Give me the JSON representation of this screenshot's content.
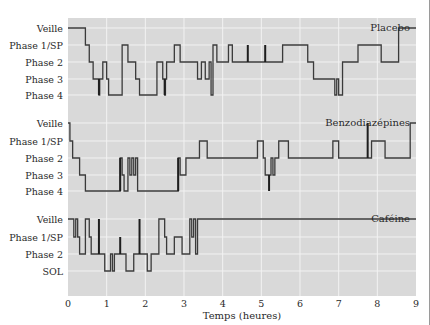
{
  "colors": {
    "plot_bg": "#d9d9d9",
    "grid": "#f2f2f2",
    "line": "#3a3a3a",
    "text": "#2a2a2a"
  },
  "chart_data": {
    "type": "line",
    "subtype": "step (hypnogram)",
    "xlabel": "Temps (heures)",
    "xlim": [
      0,
      9
    ],
    "xticks": [
      0,
      1,
      2,
      3,
      4,
      5,
      6,
      7,
      8,
      9
    ],
    "grid": true,
    "panels": [
      {
        "title": "Placebo",
        "levels": [
          "Veille",
          "Phase 1/SP",
          "Phase 2",
          "Phase 3",
          "Phase 4"
        ],
        "steps": [
          [
            0,
            0
          ],
          [
            0.45,
            1
          ],
          [
            0.55,
            2
          ],
          [
            0.65,
            3
          ],
          [
            0.8,
            4
          ],
          [
            0.82,
            3
          ],
          [
            0.9,
            2
          ],
          [
            1.0,
            3
          ],
          [
            1.05,
            4
          ],
          [
            1.4,
            1
          ],
          [
            1.55,
            2
          ],
          [
            1.75,
            3
          ],
          [
            1.85,
            4
          ],
          [
            2.3,
            2
          ],
          [
            2.45,
            3
          ],
          [
            2.5,
            4
          ],
          [
            2.52,
            3
          ],
          [
            2.55,
            2
          ],
          [
            2.75,
            1
          ],
          [
            2.9,
            2
          ],
          [
            3.35,
            3
          ],
          [
            3.45,
            2
          ],
          [
            3.55,
            3
          ],
          [
            3.65,
            2
          ],
          [
            3.7,
            4
          ],
          [
            3.75,
            1
          ],
          [
            3.85,
            2
          ],
          [
            4.15,
            1
          ],
          [
            4.25,
            2
          ],
          [
            4.65,
            2
          ],
          [
            5.1,
            2
          ],
          [
            5.55,
            1
          ],
          [
            6.2,
            2
          ],
          [
            6.35,
            3
          ],
          [
            6.9,
            4
          ],
          [
            6.95,
            3
          ],
          [
            7.0,
            4
          ],
          [
            7.1,
            2
          ],
          [
            7.5,
            1
          ],
          [
            8.1,
            2
          ],
          [
            8.55,
            0
          ],
          [
            9.0,
            0
          ]
        ],
        "spikes": [
          {
            "x": 0.8,
            "from": 3,
            "to": 4
          },
          {
            "x": 2.5,
            "from": 3,
            "to": 4
          },
          {
            "x": 4.65,
            "from": 2,
            "to": 1
          },
          {
            "x": 5.1,
            "from": 2,
            "to": 1
          }
        ]
      },
      {
        "title": "Benzodiazépines",
        "levels": [
          "Veille",
          "Phase 1/SP",
          "Phase 2",
          "Phase 3",
          "Phase 4"
        ],
        "steps": [
          [
            0,
            0
          ],
          [
            0.05,
            1
          ],
          [
            0.12,
            2
          ],
          [
            0.3,
            3
          ],
          [
            0.45,
            4
          ],
          [
            1.35,
            2
          ],
          [
            1.4,
            3
          ],
          [
            1.45,
            4
          ],
          [
            1.55,
            2
          ],
          [
            1.6,
            3
          ],
          [
            1.65,
            2
          ],
          [
            1.7,
            3
          ],
          [
            1.75,
            2
          ],
          [
            1.8,
            4
          ],
          [
            2.85,
            2
          ],
          [
            2.9,
            3
          ],
          [
            3.05,
            2
          ],
          [
            3.2,
            2
          ],
          [
            3.4,
            1
          ],
          [
            3.6,
            2
          ],
          [
            4.9,
            1
          ],
          [
            5.05,
            2
          ],
          [
            5.1,
            3
          ],
          [
            5.25,
            2
          ],
          [
            5.3,
            3
          ],
          [
            5.35,
            2
          ],
          [
            5.45,
            1
          ],
          [
            5.7,
            2
          ],
          [
            6.85,
            1
          ],
          [
            7.0,
            2
          ],
          [
            7.75,
            2
          ],
          [
            7.85,
            1
          ],
          [
            8.2,
            2
          ],
          [
            8.85,
            0
          ],
          [
            9.0,
            0
          ]
        ],
        "spikes": [
          {
            "x": 1.35,
            "from": 4,
            "to": 2
          },
          {
            "x": 2.85,
            "from": 4,
            "to": 2
          },
          {
            "x": 5.2,
            "from": 3,
            "to": 4
          },
          {
            "x": 7.75,
            "from": 2,
            "to": 0
          }
        ]
      },
      {
        "title": "Caféine",
        "levels": [
          "Veille",
          "Phase 1/SP",
          "Phase 2",
          "SOL"
        ],
        "steps": [
          [
            0,
            0
          ],
          [
            0.15,
            1
          ],
          [
            0.2,
            0
          ],
          [
            0.25,
            1
          ],
          [
            0.3,
            2
          ],
          [
            0.45,
            0
          ],
          [
            0.55,
            1
          ],
          [
            0.6,
            2
          ],
          [
            0.85,
            2
          ],
          [
            0.95,
            3
          ],
          [
            1.1,
            2
          ],
          [
            1.15,
            3
          ],
          [
            1.2,
            2
          ],
          [
            1.5,
            3
          ],
          [
            1.7,
            2
          ],
          [
            1.95,
            2
          ],
          [
            2.05,
            3
          ],
          [
            2.15,
            2
          ],
          [
            2.35,
            0
          ],
          [
            2.5,
            1
          ],
          [
            2.55,
            2
          ],
          [
            2.75,
            1
          ],
          [
            2.95,
            2
          ],
          [
            3.15,
            0
          ],
          [
            3.2,
            1
          ],
          [
            3.25,
            0
          ],
          [
            3.3,
            2
          ],
          [
            3.35,
            0
          ],
          [
            9.0,
            0
          ]
        ],
        "spikes": [
          {
            "x": 0.8,
            "from": 2,
            "to": 0
          },
          {
            "x": 1.35,
            "from": 2,
            "to": 1
          },
          {
            "x": 1.85,
            "from": 2,
            "to": 0
          }
        ]
      }
    ]
  }
}
